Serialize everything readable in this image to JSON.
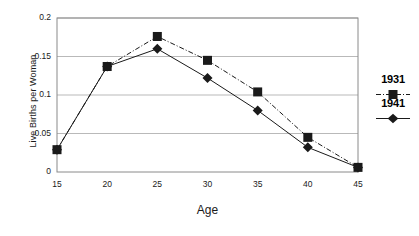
{
  "chart_data": {
    "type": "line",
    "title": "",
    "xlabel": "Age",
    "ylabel": "Live Births per Woman",
    "x": [
      15,
      20,
      25,
      30,
      35,
      40,
      45
    ],
    "xtick_labels": [
      "15",
      "20",
      "25",
      "30",
      "35",
      "40",
      "45"
    ],
    "ytick_labels": [
      "0",
      "0.05",
      "0.1",
      "0.15",
      "0.2"
    ],
    "ytick_values": [
      0,
      0.05,
      0.1,
      0.15,
      0.2
    ],
    "xlim": [
      15,
      45
    ],
    "ylim": [
      0,
      0.2
    ],
    "grid": "horizontal",
    "legend_position": "right",
    "series": [
      {
        "name": "1931",
        "marker": "square",
        "line_style": "dash-dot",
        "color": "#1a1a1a",
        "values": [
          0.029,
          0.137,
          0.176,
          0.145,
          0.104,
          0.045,
          0.006
        ]
      },
      {
        "name": "1941",
        "marker": "diamond",
        "line_style": "solid",
        "color": "#1a1a1a",
        "values": [
          0.029,
          0.137,
          0.16,
          0.122,
          0.08,
          0.032,
          0.006
        ]
      }
    ]
  },
  "legend": {
    "entries": [
      {
        "label": "1931",
        "marker": "square-marker-icon"
      },
      {
        "label": "1941",
        "marker": "diamond-marker-icon"
      }
    ]
  },
  "axes": {
    "x_title": "Age",
    "y_title": "Live Births per Woman"
  },
  "colors": {
    "background": "#ffffff",
    "axis": "#7a7a7a",
    "grid": "#b9b9b9",
    "series": "#1a1a1a",
    "text": "#1a1a1a"
  }
}
